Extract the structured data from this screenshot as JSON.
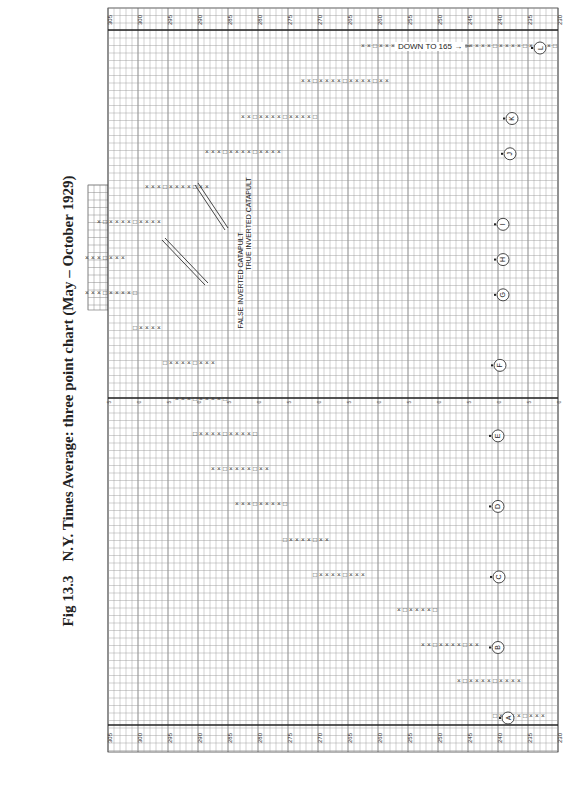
{
  "figure": {
    "number": "Fig 13.3",
    "title": "N.Y. Times Average: three point chart (May – October 1929)"
  },
  "annotations": {
    "false_catapult": "FALSE INVERTED CATAPULT",
    "true_catapult": "TRUE INVERTED CATAPULT",
    "down_to": "DOWN TO 165 →"
  },
  "chart_data": {
    "type": "point-and-figure",
    "title": "N.Y. Times Average: three point chart (May – October 1929)",
    "box_size": 3,
    "orientation": "rotated 90° — price axis horizontal (high at left), time advances upward",
    "price_axis_labels": [
      "305",
      "300",
      "295",
      "290",
      "285",
      "280",
      "275",
      "270",
      "265",
      "260",
      "255",
      "250",
      "245",
      "240",
      "235",
      "230"
    ],
    "section_divider_labels": [
      "5",
      "0",
      "5",
      "0",
      "5",
      "0",
      "5",
      "0",
      "5",
      "0",
      "5",
      "0",
      "5",
      "0",
      "5",
      "0"
    ],
    "markers": [
      "A",
      "B",
      "C",
      "D",
      "E",
      "F",
      "G",
      "H",
      "I",
      "J",
      "K",
      "L"
    ],
    "annotations": [
      "FALSE INVERTED CATAPULT",
      "TRUE INVERTED CATAPULT",
      "DOWN TO 165"
    ],
    "approx_columns": [
      {
        "marker": "A",
        "range": [
          232,
          240
        ]
      },
      {
        "range": [
          236,
          246
        ]
      },
      {
        "marker": "B",
        "range": [
          243,
          252
        ]
      },
      {
        "range": [
          250,
          256
        ]
      },
      {
        "marker": "C",
        "range": [
          262,
          270
        ]
      },
      {
        "range": [
          268,
          275
        ]
      },
      {
        "marker": "D",
        "range": [
          275,
          283
        ]
      },
      {
        "range": [
          278,
          287
        ]
      },
      {
        "marker": "E",
        "range": [
          280,
          290
        ]
      },
      {
        "range": [
          285,
          293
        ]
      },
      {
        "marker": "F",
        "range": [
          287,
          295
        ]
      },
      {
        "range": [
          296,
          300
        ]
      },
      {
        "marker": "G",
        "range": [
          300,
          310
        ]
      },
      {
        "marker": "H",
        "range": [
          302,
          312
        ]
      },
      {
        "marker": "I",
        "range": [
          296,
          306
        ]
      },
      {
        "range": [
          288,
          298
        ]
      },
      {
        "marker": "J",
        "range": [
          276,
          288
        ]
      },
      {
        "marker": "K",
        "range": [
          270,
          282
        ]
      },
      {
        "range": [
          258,
          272
        ]
      },
      {
        "marker": "L",
        "range": [
          230,
          262
        ]
      }
    ],
    "xlabel": "Price (index points)",
    "ylabel": "Time (May – October 1929)",
    "grid": true
  }
}
